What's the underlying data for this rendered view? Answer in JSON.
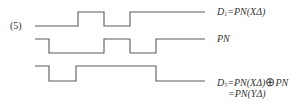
{
  "figure": {
    "number": "(5)",
    "signals": [
      {
        "name": "D1",
        "label_main": "D",
        "label_sub": "1",
        "label_rest": "=PN(XΔ)",
        "points": "35,26 78,26 78,12 104,12 104,26 130,26 130,12 205,12"
      },
      {
        "name": "PN",
        "label_main": "PN",
        "points": "35,39 49,39 49,53 104,53 104,39 130,39 130,53 156,53 156,39 205,39"
      },
      {
        "name": "D5",
        "label_main": "D",
        "label_sub": "5",
        "label_rest": "=PN(XΔ)",
        "label_op": "⊕",
        "label_tail": "PN",
        "label_line2": "=PN(YΔ)",
        "points": "35,66 49,66 49,81 76,81 76,66 156,66 156,81 205,81"
      }
    ],
    "stroke_color": "#5a5a5a"
  }
}
